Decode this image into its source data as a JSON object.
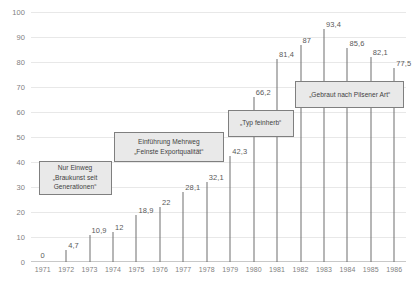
{
  "chart_data": {
    "type": "bar",
    "title": "",
    "xlabel": "",
    "ylabel": "",
    "ylim": [
      0,
      100
    ],
    "ytick_step": 10,
    "grid": true,
    "legend": false,
    "categories": [
      "1971",
      "1972",
      "1973",
      "1974",
      "1975",
      "1976",
      "1977",
      "1978",
      "1979",
      "1980",
      "1981",
      "1982",
      "1983",
      "1984",
      "1985",
      "1986"
    ],
    "values": [
      0,
      4.7,
      10.9,
      12,
      18.9,
      22,
      28.1,
      32.1,
      42.3,
      66.2,
      81.4,
      87,
      93.4,
      85.6,
      82.1,
      77.5
    ],
    "value_labels": [
      "0",
      "4,7",
      "10,9",
      "12",
      "18,9",
      "22",
      "28,1",
      "32,1",
      "42,3",
      "66,2",
      "81,4",
      "87",
      "93,4",
      "85,6",
      "82,1",
      "77,5"
    ],
    "ytick_labels": [
      "0",
      "10",
      "20",
      "30",
      "40",
      "50",
      "60",
      "70",
      "80",
      "90",
      "100"
    ],
    "annotations": [
      {
        "id": "nur-einweg",
        "lines": [
          "Nur Einweg",
          "„Braukunst seit",
          "Generationen“"
        ],
        "x_pct": 2.0,
        "y_value": 40.5,
        "width_pct": 19.5,
        "height_pct": 13.5
      },
      {
        "id": "einfuehrung-mehrweg",
        "lines": [
          "Einführung Mehrweg",
          "„Feinste Exportqualität“"
        ],
        "x_pct": 22.0,
        "y_value": 52.0,
        "width_pct": 29.5,
        "height_pct": 12.0
      },
      {
        "id": "typ-feinherb",
        "lines": [
          "„Typ feinherb“"
        ],
        "x_pct": 52.5,
        "y_value": 61.0,
        "width_pct": 17.5,
        "height_pct": 11.0
      },
      {
        "id": "gebraut-pilsener",
        "lines": [
          "„Gebraut nach Pilsener Art“"
        ],
        "x_pct": 70.5,
        "y_value": 72.5,
        "width_pct": 29.0,
        "height_pct": 11.0
      }
    ],
    "colors": {
      "background": "#ffffff",
      "stem": "#6f6f6f",
      "gridline": "#e8e8e8",
      "tick_text": "#7f7f7f",
      "label_text": "#5a5a5a",
      "callout_fill": "#e9e9e9",
      "callout_border": "#7f7f7f"
    }
  }
}
